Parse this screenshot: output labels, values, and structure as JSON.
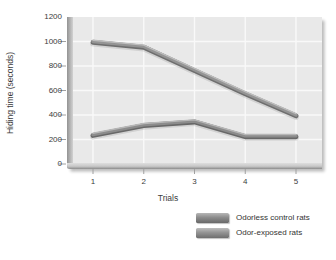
{
  "chart_data": {
    "type": "line",
    "title": "",
    "xlabel": "Trials",
    "ylabel": "Hiding time (seconds)",
    "x": [
      1,
      2,
      3,
      4,
      5
    ],
    "xticks": [
      1,
      2,
      3,
      4,
      5
    ],
    "ylim": [
      0,
      1200
    ],
    "yticks": [
      0,
      200,
      400,
      600,
      800,
      1000,
      1200
    ],
    "grid": true,
    "legend_position": "bottom-right",
    "series": [
      {
        "name": "Odorless control rats",
        "values": [
          240,
          320,
          350,
          230,
          230
        ],
        "color_top": "#b7b7b7",
        "color": "#8c8c8c",
        "color_dark": "#686868"
      },
      {
        "name": "Odor-exposed rats",
        "values": [
          1000,
          960,
          770,
          580,
          400
        ],
        "color_top": "#bdbdbd",
        "color": "#949494",
        "color_dark": "#6e6e6e"
      }
    ]
  },
  "colors": {
    "figure_bg": "#ffffff",
    "panel_bg": "#e9e9e9",
    "grid_line": "#f9f9f9",
    "axis_text": "#3c3c3c",
    "tick_mark": "#a0a0a0"
  }
}
